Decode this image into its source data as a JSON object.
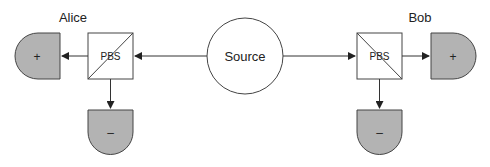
{
  "diagram": {
    "source": {
      "label": "Source"
    },
    "alice": {
      "name": "Alice",
      "pbs_label": "PBS",
      "detector_plus": "+",
      "detector_minus": "–"
    },
    "bob": {
      "name": "Bob",
      "pbs_label": "PBS",
      "detector_plus": "+",
      "detector_minus": "–"
    },
    "colors": {
      "line": "#333333",
      "detector_fill": "#b3b3b3",
      "box_fill": "#ffffff"
    }
  }
}
